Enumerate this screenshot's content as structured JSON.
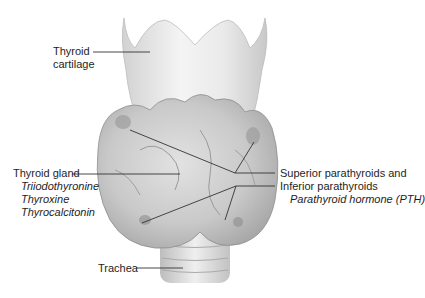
{
  "diagram": {
    "type": "anatomical-illustration",
    "labels": {
      "thyroid_cartilage": {
        "line1": "Thyroid",
        "line2": "cartilage"
      },
      "thyroid_gland": {
        "title": "Thyroid gland",
        "hormones": [
          "Triiodothyronine",
          "Thyroxine",
          "Thyrocalcitonin"
        ]
      },
      "parathyroids": {
        "superior": "Superior parathyroids and",
        "inferior": "Inferior parathyroids",
        "hormone": "Parathyroid hormone (PTH)"
      },
      "trachea": "Trachea"
    }
  }
}
